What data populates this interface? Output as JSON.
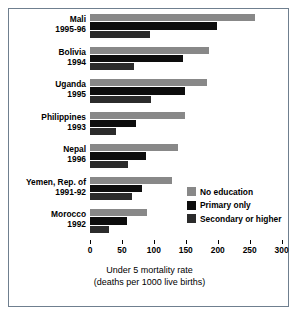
{
  "chart_data": {
    "type": "bar",
    "orientation": "horizontal",
    "title": "",
    "xlabel": "Under 5 mortality rate",
    "xlabel_sub": "(deaths per 1000 live births)",
    "ylabel": "",
    "xlim": [
      0,
      310
    ],
    "xticks": [
      0,
      50,
      100,
      150,
      200,
      250,
      300
    ],
    "xtick_labels": [
      "0",
      "50",
      "100",
      "150",
      "200",
      "250",
      "300"
    ],
    "grid": false,
    "legend_position": "middle-right",
    "categories": [
      "Mali 1995-96",
      "Bolivia 1994",
      "Uganda 1995",
      "Philippines 1993",
      "Nepal 1996",
      "Yemen, Rep. of 1991-92",
      "Morocco 1992"
    ],
    "category_lines": [
      [
        "Mali",
        "1995-96"
      ],
      [
        "Bolivia",
        "1994"
      ],
      [
        "Uganda",
        "1995"
      ],
      [
        "Philippines",
        "1993"
      ],
      [
        "Nepal",
        "1996"
      ],
      [
        "Yemen, Rep. of",
        "1991-92"
      ],
      [
        "Morocco",
        "1992"
      ]
    ],
    "series": [
      {
        "name": "No education",
        "color": "#888888",
        "values": [
          258,
          186,
          183,
          148,
          138,
          128,
          90
        ]
      },
      {
        "name": "Primary only",
        "color": "#0d0d0d",
        "values": [
          199,
          146,
          148,
          72,
          88,
          81,
          58
        ]
      },
      {
        "name": "Secondary or higher",
        "color": "#2b2b2b",
        "values": [
          94,
          69,
          95,
          41,
          59,
          65,
          30
        ]
      }
    ],
    "legend": [
      {
        "label": "No education",
        "color": "#888888"
      },
      {
        "label": "Primary only",
        "color": "#0d0d0d"
      },
      {
        "label": "Secondary or higher",
        "color": "#2b2b2b"
      }
    ],
    "frame_color": "#6f7f8f",
    "background": "#ffffff"
  }
}
